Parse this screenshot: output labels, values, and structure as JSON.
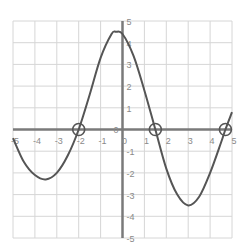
{
  "chart_data": {
    "type": "line",
    "title": "",
    "xlabel": "",
    "ylabel": "",
    "xlim": [
      -5,
      5
    ],
    "ylim": [
      -5,
      5
    ],
    "grid": true,
    "x_ticks": [
      -5,
      -4,
      -3,
      -2,
      -1,
      0,
      1,
      2,
      3,
      4,
      5
    ],
    "x_tick_labels": [
      "-5",
      "-4",
      "-3",
      "-2",
      "-1",
      "0",
      "1",
      "2",
      "3",
      "4",
      "5"
    ],
    "y_ticks": [
      -5,
      -4,
      -3,
      -2,
      -1,
      0,
      1,
      2,
      3,
      4,
      5
    ],
    "y_tick_labels": [
      "-5",
      "-4",
      "-3",
      "-2",
      "-1",
      "0",
      "1",
      "2",
      "3",
      "4",
      "5"
    ],
    "series": [
      {
        "name": "f(x)",
        "x": [
          -5,
          -4.5,
          -4,
          -3.5,
          -3,
          -2.5,
          -2,
          -1.5,
          -1,
          -0.5,
          -0.3,
          0,
          0.5,
          1,
          1.5,
          2,
          2.5,
          3,
          3.5,
          4,
          4.5,
          4.7,
          5
        ],
        "y": [
          -0.4,
          -1.5,
          -2.1,
          -2.3,
          -2.0,
          -1.2,
          0,
          1.6,
          3.3,
          4.4,
          4.5,
          4.4,
          3.4,
          1.8,
          0,
          -1.8,
          -3.0,
          -3.5,
          -3.1,
          -2.0,
          -0.6,
          0,
          0.8
        ]
      }
    ],
    "annotations": [
      {
        "type": "open-circle",
        "x": -2,
        "y": 0,
        "label": "zero"
      },
      {
        "type": "open-circle",
        "x": 1.5,
        "y": 0,
        "label": "zero"
      },
      {
        "type": "open-circle",
        "x": 4.7,
        "y": 0,
        "label": "zero"
      }
    ]
  },
  "colors": {
    "grid": "#d6d6d6",
    "axis": "#7a7a7a",
    "curve": "#555555",
    "tick_text": "#8a8a8a"
  }
}
